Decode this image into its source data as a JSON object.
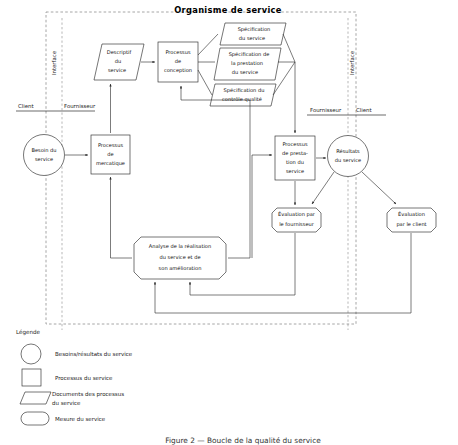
{
  "figure": {
    "title": "Organisme de service",
    "caption": "Figure 2 — Boucle de la qualité du service"
  },
  "interface_labels": {
    "left_vertical": "Interface",
    "right_vertical": "Interface",
    "left_pair": {
      "client": "Client",
      "fournisseur": "Fournisseur"
    },
    "right_pair": {
      "fournisseur": "Fournisseur",
      "client": "Client"
    }
  },
  "nodes": {
    "besoin": {
      "label_lines": [
        "Besoin du",
        "service"
      ],
      "shape": "circle"
    },
    "mercatique": {
      "label_lines": [
        "Processus",
        "de",
        "mercatique"
      ],
      "shape": "rect"
    },
    "descriptif": {
      "label_lines": [
        "Descriptif",
        "du",
        "service"
      ],
      "shape": "parallelogram"
    },
    "conception": {
      "label_lines": [
        "Processus",
        "de",
        "conception"
      ],
      "shape": "rect"
    },
    "spec_service": {
      "label_lines": [
        "Spécification",
        "du service"
      ],
      "shape": "parallelogram"
    },
    "spec_prestation": {
      "label_lines": [
        "Spécification de",
        "la prestation",
        "du service"
      ],
      "shape": "parallelogram"
    },
    "spec_controle": {
      "label_lines": [
        "Spécification du",
        "contrôle qualité"
      ],
      "shape": "parallelogram"
    },
    "prestation": {
      "label_lines": [
        "Processus",
        "de presta-",
        "tion du",
        "service"
      ],
      "shape": "rect"
    },
    "resultats": {
      "label_lines": [
        "Résultats",
        "du service"
      ],
      "shape": "circle"
    },
    "eval_fournisseur": {
      "label_lines": [
        "Évaluation par",
        "le fournisseur"
      ],
      "shape": "octagon"
    },
    "eval_client": {
      "label_lines": [
        "Évaluation",
        "par le client"
      ],
      "shape": "octagon"
    },
    "analyse": {
      "label_lines": [
        "Analyse de la réalisation",
        "du service et de",
        "son amélioration"
      ],
      "shape": "octagon"
    }
  },
  "legend": {
    "title": "Légende",
    "items": [
      {
        "shape": "circle",
        "label_lines": [
          "Besoins/résultats du service"
        ]
      },
      {
        "shape": "rect",
        "label_lines": [
          "Processus du service"
        ]
      },
      {
        "shape": "parallelogram",
        "label_lines": [
          "Documents des processus",
          "du service"
        ]
      },
      {
        "shape": "stadium",
        "label_lines": [
          "Mesure du service"
        ]
      }
    ]
  },
  "colors": {
    "stroke": "#2b2b2b",
    "dashed": "#8a8a8a",
    "background": "#ffffff",
    "text": "#1a1a1a"
  }
}
